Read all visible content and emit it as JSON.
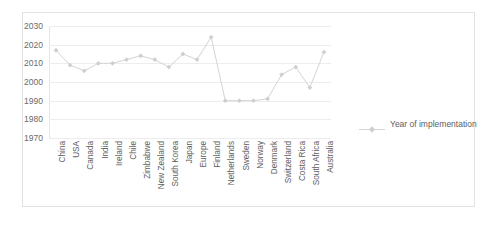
{
  "chart_data": {
    "type": "line",
    "title": "",
    "xlabel": "",
    "ylabel": "",
    "ylim": [
      1970,
      2030
    ],
    "ytick_step": 10,
    "yticks": [
      2030,
      2020,
      2010,
      2000,
      1990,
      1980,
      1970
    ],
    "grid": true,
    "legend_position": "right",
    "series_name": "Year of implementation",
    "marker": "diamond",
    "line_color": "#d4d4d4",
    "marker_color": "#cfcfcf",
    "grid_color": "#ededed",
    "categories": [
      "China",
      "USA",
      "Canada",
      "India",
      "Ireland",
      "Chile",
      "Zimbabwe",
      "New Zealand",
      "South Korea",
      "Japan",
      "Europe",
      "Finland",
      "Netherlands",
      "Sweden",
      "Norway",
      "Denmark",
      "Switzerland",
      "Costa Rica",
      "South Africa",
      "Australia"
    ],
    "values": [
      2017,
      2009,
      2006,
      2010,
      2010,
      2012,
      2014,
      2012,
      2008,
      2015,
      2012,
      2024,
      1990,
      1990,
      1990,
      1991,
      2004,
      2008,
      1997,
      2016
    ],
    "values_tail": [
      2012
    ]
  },
  "legend": {
    "label": "Year of implementation"
  }
}
